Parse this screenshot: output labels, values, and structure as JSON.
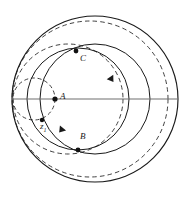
{
  "figure": {
    "canvas": {
      "width": 186,
      "height": 197,
      "background": "#ffffff"
    },
    "colors": {
      "stroke_solid": "#1a1a1a",
      "stroke_dashed": "#2b2b2b",
      "axis": "#6e6e6e",
      "point_fill": "#111111",
      "label_text": "#1a1a1a"
    },
    "labels": {
      "A": "A",
      "B": "B",
      "C": "C",
      "z1_base": "z",
      "z1_sub": "1"
    },
    "points": [
      {
        "name": "A",
        "x": 55,
        "y": 99
      },
      {
        "name": "C",
        "x": 76,
        "y": 51
      },
      {
        "name": "B",
        "x": 78,
        "y": 150
      },
      {
        "name": "z1",
        "x": 42,
        "y": 120
      }
    ],
    "circles": [
      {
        "name": "outer-boundary-circle",
        "cx": 95,
        "cy": 99,
        "r": 83,
        "style": "solid"
      },
      {
        "name": "inner-solid-circle",
        "cx": 95,
        "cy": 99,
        "r": 55,
        "style": "solid"
      },
      {
        "name": "medium-solid-circle",
        "cx": 78,
        "cy": 99,
        "r": 51,
        "style": "solid"
      },
      {
        "name": "large-dashed-circle",
        "cx": 90,
        "cy": 99,
        "r": 78,
        "style": "dashed"
      },
      {
        "name": "medium-dashed-circle",
        "cx": 68,
        "cy": 99,
        "r": 55,
        "style": "dashed"
      },
      {
        "name": "small-dashed-circle",
        "cx": 34,
        "cy": 99,
        "r": 21,
        "style": "dashed"
      }
    ],
    "axis": {
      "name": "horizontal-diameter-line",
      "x1": 12,
      "y1": 99,
      "x2": 178,
      "y2": 99
    },
    "arrows": [
      {
        "name": "arrow-inner-upper-right",
        "x": 110,
        "y": 77,
        "angle": 55
      },
      {
        "name": "arrow-medium-lower-left",
        "x": 63,
        "y": 128,
        "angle": 130
      }
    ]
  }
}
